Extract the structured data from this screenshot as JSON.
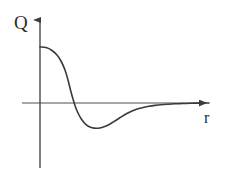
{
  "figure": {
    "width": 227,
    "height": 176,
    "background_color": "#ffffff"
  },
  "axes": {
    "y_axis": {
      "label": "Q",
      "name": "y-axis",
      "color": "#4a4a4a",
      "x": 40,
      "top_y": 14,
      "bottom_y": 168,
      "arrow": "up"
    },
    "x_axis": {
      "label": "r",
      "name": "x-axis",
      "color": "#8a8a8a",
      "y": 103,
      "left_x": 22,
      "right_x": 212,
      "arrow": "right"
    }
  },
  "chart_data": {
    "type": "line",
    "title": "",
    "subtitle": "",
    "xlabel": "r",
    "ylabel": "Q",
    "grid": false,
    "legend": null,
    "annotations": [],
    "axis_origin_px": {
      "x": 40,
      "y": 103
    },
    "xlim": [
      0,
      212
    ],
    "ylim": [
      -40,
      90
    ],
    "tick_labels": {
      "x": [],
      "y": []
    },
    "series": [
      {
        "name": "Q(r)",
        "color": "#3a3a3a",
        "line_width": 1.6,
        "description": "Starts positive on the Q axis, falls sigmoidally through zero, dips to a negative minimum, then rises and asymptotically approaches zero from below.",
        "zero_crossing_px_x": 69,
        "minimum_px": {
          "x": 97,
          "y": 128
        },
        "start_px": {
          "x": 40,
          "y": 47
        },
        "end_px": {
          "x": 209,
          "y": 103
        },
        "points_px": [
          [
            40,
            47
          ],
          [
            46,
            47.6
          ],
          [
            52,
            50.5
          ],
          [
            57,
            55
          ],
          [
            61,
            61
          ],
          [
            65,
            70
          ],
          [
            68,
            80
          ],
          [
            70.5,
            90
          ],
          [
            73,
            99
          ],
          [
            75.5,
            107
          ],
          [
            78,
            113
          ],
          [
            81,
            118.5
          ],
          [
            84,
            122.5
          ],
          [
            87,
            125.4
          ],
          [
            90,
            127
          ],
          [
            94,
            128.1
          ],
          [
            98,
            128.2
          ],
          [
            102,
            127.4
          ],
          [
            106,
            126
          ],
          [
            110,
            124
          ],
          [
            114,
            121.6
          ],
          [
            118,
            119
          ],
          [
            122,
            116.4
          ],
          [
            126,
            114
          ],
          [
            130,
            112
          ],
          [
            134,
            110.3
          ],
          [
            139,
            108.6
          ],
          [
            144,
            107.3
          ],
          [
            149,
            106.3
          ],
          [
            155,
            105.4
          ],
          [
            161,
            104.7
          ],
          [
            168,
            104.2
          ],
          [
            175,
            103.8
          ],
          [
            183,
            103.5
          ],
          [
            191,
            103.3
          ],
          [
            200,
            103.1
          ],
          [
            209,
            103.0
          ]
        ]
      }
    ]
  }
}
